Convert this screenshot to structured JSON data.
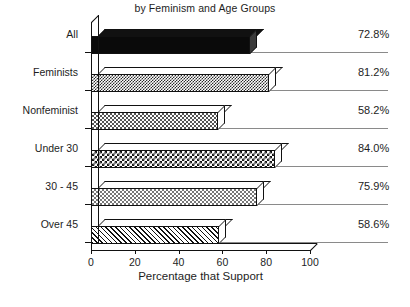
{
  "chart_data": {
    "type": "bar",
    "orientation": "horizontal",
    "title": "by Feminism and Age Groups",
    "xlabel": "Percentage that Support",
    "ylabel": "",
    "xlim": [
      0,
      100
    ],
    "xticks": [
      0,
      20,
      40,
      60,
      80,
      100
    ],
    "grid": false,
    "legend": "none",
    "style_note": "3-D monochrome horizontal bars with patterned fills",
    "categories": [
      "All",
      "Feminists",
      "Nonfeminist",
      "Under 30",
      "30 - 45",
      "Over 45"
    ],
    "values": [
      72.8,
      81.2,
      58.2,
      84.0,
      75.9,
      58.6
    ],
    "value_labels": [
      "72.8%",
      "81.2%",
      "58.2%",
      "84.0%",
      "75.9%",
      "58.6%"
    ],
    "bar_patterns": [
      "solid-black",
      "checker-dark",
      "checker-light",
      "checker-bold",
      "checker-pale",
      "diagonal-hatch"
    ],
    "bars": [
      {
        "category": "All",
        "value": 72.8,
        "label": "72.8%",
        "pattern": "solid-black"
      },
      {
        "category": "Feminists",
        "value": 81.2,
        "label": "81.2%",
        "pattern": "checker-dark"
      },
      {
        "category": "Nonfeminist",
        "value": 58.2,
        "label": "58.2%",
        "pattern": "checker-light"
      },
      {
        "category": "Under 30",
        "value": 84.0,
        "label": "84.0%",
        "pattern": "checker-bold"
      },
      {
        "category": "30 - 45",
        "value": 75.9,
        "label": "75.9%",
        "pattern": "checker-pale"
      },
      {
        "category": "Over 45",
        "value": 58.6,
        "label": "58.6%",
        "pattern": "diagonal-hatch"
      }
    ]
  },
  "colors": {
    "axis": "#111111",
    "separator": "#8a8a8a",
    "text": "#1d1d1d",
    "background": "#ffffff"
  },
  "footnote": ""
}
